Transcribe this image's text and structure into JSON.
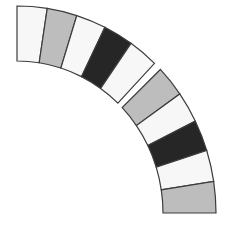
{
  "diagram": {
    "center": [
      17,
      213
    ],
    "outer_radius": [
      199,
      207
    ],
    "inner_radius": [
      146,
      152
    ],
    "stroke_color": "#3c3c3c",
    "colors": {
      "white": "#f7f7f7",
      "gray": "#bdbdbd",
      "black": "#262626"
    },
    "groups": [
      {
        "name": "upper-group",
        "start_angle": 90,
        "end_angle": 46.3,
        "segments": [
          "white",
          "gray",
          "white",
          "black",
          "white"
        ]
      },
      {
        "name": "lower-group",
        "start_angle": 43.9,
        "end_angle": 0,
        "segments": [
          "gray",
          "white",
          "black",
          "white",
          "gray"
        ]
      }
    ]
  }
}
